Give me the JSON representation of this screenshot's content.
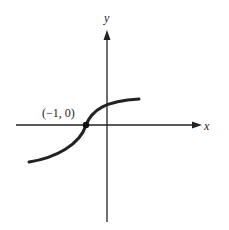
{
  "axes": {
    "x_label": "x",
    "y_label": "y"
  },
  "point": {
    "label": "(−1, 0)"
  },
  "colors": {
    "stroke": "#222222",
    "background": "#ffffff"
  }
}
